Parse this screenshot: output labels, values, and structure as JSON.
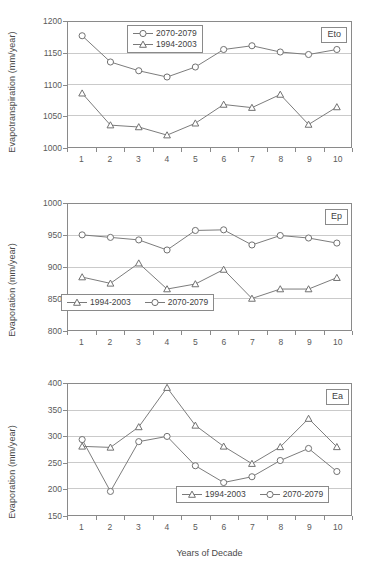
{
  "chart_data": [
    {
      "type": "line",
      "panel_tag": "Eto",
      "title": "",
      "xlabel": "",
      "ylabel": "Evapotranspiration (mm/year)",
      "categories": [
        "1",
        "2",
        "3",
        "4",
        "5",
        "6",
        "7",
        "8",
        "9",
        "10"
      ],
      "ylim": [
        1000,
        1200
      ],
      "yticks": [
        1200,
        1150,
        1100,
        1050,
        1000
      ],
      "grid": true,
      "legend_position": "top-center",
      "legend_orientation": "vertical",
      "series": [
        {
          "name": "2070-2079",
          "marker": "circle",
          "values": [
            1178,
            1136,
            1122,
            1112,
            1128,
            1156,
            1162,
            1152,
            1148,
            1156
          ]
        },
        {
          "name": "1994-2003",
          "marker": "triangle",
          "values": [
            1086,
            1035,
            1032,
            1019,
            1038,
            1068,
            1063,
            1084,
            1036,
            1064
          ]
        }
      ]
    },
    {
      "type": "line",
      "panel_tag": "Ep",
      "title": "",
      "xlabel": "",
      "ylabel": "Evaporation (mm/year)",
      "categories": [
        "1",
        "2",
        "3",
        "4",
        "5",
        "6",
        "7",
        "8",
        "9",
        "10"
      ],
      "ylim": [
        800,
        1000
      ],
      "yticks": [
        1000,
        950,
        900,
        850,
        800
      ],
      "grid": true,
      "legend_position": "bottom-left",
      "legend_orientation": "horizontal",
      "series": [
        {
          "name": "1994-2003",
          "marker": "triangle",
          "values": [
            884,
            874,
            906,
            865,
            873,
            896,
            850,
            865,
            865,
            883
          ]
        },
        {
          "name": "2070-2079",
          "marker": "circle",
          "values": [
            951,
            947,
            943,
            927,
            958,
            959,
            935,
            950,
            946,
            938
          ]
        }
      ]
    },
    {
      "type": "line",
      "panel_tag": "Ea",
      "title": "",
      "xlabel": "Years of Decade",
      "ylabel": "Evaporation (mm/year)",
      "categories": [
        "1",
        "2",
        "3",
        "4",
        "5",
        "6",
        "7",
        "8",
        "9",
        "10"
      ],
      "ylim": [
        150,
        400
      ],
      "yticks": [
        400,
        350,
        300,
        250,
        200,
        150
      ],
      "grid": true,
      "legend_position": "bottom-right",
      "legend_orientation": "horizontal",
      "series": [
        {
          "name": "1994-2003",
          "marker": "triangle",
          "values": [
            281,
            279,
            318,
            393,
            321,
            281,
            248,
            280,
            334,
            280
          ]
        },
        {
          "name": "2070-2079",
          "marker": "circle",
          "values": [
            294,
            195,
            290,
            300,
            244,
            212,
            223,
            254,
            277,
            233
          ]
        }
      ]
    }
  ],
  "colors": {
    "line": "#7a7a7a",
    "marker_stroke": "#6f6f6f",
    "marker_fill": "#ffffff",
    "grid": "#c9c9c9",
    "axis": "#8a8a8a",
    "text": "#4a4a4a"
  }
}
